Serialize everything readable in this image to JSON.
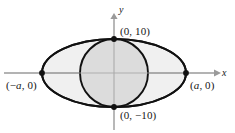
{
  "figure": {
    "background": "#ffffff",
    "width": 235,
    "height": 133
  },
  "axes": {
    "x_label": "x",
    "y_label": "y",
    "origin": {
      "x": 114,
      "y": 73
    },
    "color": "#9a9a9a",
    "x_start": {
      "x": 4,
      "y": 73
    },
    "x_end": {
      "x": 219,
      "y": 73
    },
    "y_start": {
      "x": 114,
      "y": 130
    },
    "y_end": {
      "x": 114,
      "y": 14
    }
  },
  "shapes": [
    {
      "name": "outer-ellipse",
      "type": "ellipse",
      "cx": 114,
      "cy": 73,
      "rx": 72,
      "ry": 34,
      "fill": "#f0f0f0",
      "stroke": "#111111",
      "stroke_width": 1.9
    },
    {
      "name": "inner-circle",
      "type": "ellipse",
      "cx": 114,
      "cy": 73,
      "rx": 34,
      "ry": 34,
      "fill": "#dcdcdc",
      "stroke": "#111111",
      "stroke_width": 1.9
    }
  ],
  "points": [
    {
      "name": "top-vertex",
      "label": "(0, 10)",
      "x": 114,
      "y": 39
    },
    {
      "name": "bottom-vertex",
      "label": "(0, −10)",
      "x": 114,
      "y": 107
    },
    {
      "name": "left-vertex",
      "label_prefix": "(−",
      "label_var": "a",
      "label_suffix": ", 0)",
      "x": 42,
      "y": 73
    },
    {
      "name": "right-vertex",
      "label_prefix": "(",
      "label_var": "a",
      "label_suffix": ", 0)",
      "x": 186,
      "y": 73
    }
  ],
  "labels": {
    "top": "(0, 10)",
    "bottom": "(0, −10)",
    "left_prefix": "(−",
    "left_var": "a",
    "left_suffix": ", 0)",
    "right_prefix": "(",
    "right_var": "a",
    "right_suffix": ", 0)",
    "axis_x": "x",
    "axis_y": "y"
  },
  "colors": {
    "outer_fill": "#f0f0f0",
    "inner_fill": "#dcdcdc",
    "curve_stroke": "#111111",
    "axis_stroke": "#9a9a9a",
    "point_fill": "#111111",
    "text": "#161616"
  }
}
